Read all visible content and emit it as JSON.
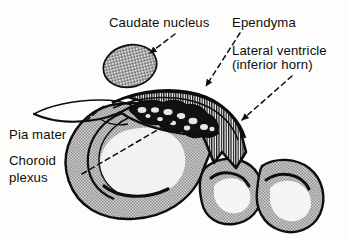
{
  "figure": {
    "background_color": "#fdfdfb",
    "ink_color": "#0d0d0d",
    "tissue_fill": "#b8b8b8",
    "labels": [
      {
        "id": "caudate",
        "text": "Caudate nucleus",
        "x": 109,
        "y": 15
      },
      {
        "id": "ependyma",
        "text": "Ependyma",
        "x": 232,
        "y": 15
      },
      {
        "id": "lv_line1",
        "text": "Lateral ventricle",
        "x": 232,
        "y": 43
      },
      {
        "id": "lv_line2",
        "text": "(inferior horn)",
        "x": 232,
        "y": 57
      },
      {
        "id": "pia",
        "text": "Pia mater",
        "x": 9,
        "y": 127
      },
      {
        "id": "chor1",
        "text": "Choroid",
        "x": 9,
        "y": 153
      },
      {
        "id": "chor2",
        "text": "plexus",
        "x": 9,
        "y": 170
      }
    ],
    "structures": [
      {
        "name": "caudate-nucleus",
        "fill": "cross-hatch"
      },
      {
        "name": "ependyma",
        "fill": "vertical-stripe"
      },
      {
        "name": "choroid-plexus",
        "fill": "dark-lobulated"
      },
      {
        "name": "pia-mater",
        "fill": "thin-line"
      },
      {
        "name": "cerebral-cortex",
        "fill": "stipple-gray"
      }
    ],
    "leaders": [
      {
        "name": "caudate-leader",
        "style": "dashed-with-arrowhead"
      },
      {
        "name": "ependyma-leader",
        "style": "dashed-with-arrowhead"
      },
      {
        "name": "lv-leader",
        "style": "dashed-with-arrowhead"
      },
      {
        "name": "pia-leader",
        "style": "dashed-plain"
      },
      {
        "name": "choroid-leader",
        "style": "dashed-plain"
      }
    ]
  }
}
